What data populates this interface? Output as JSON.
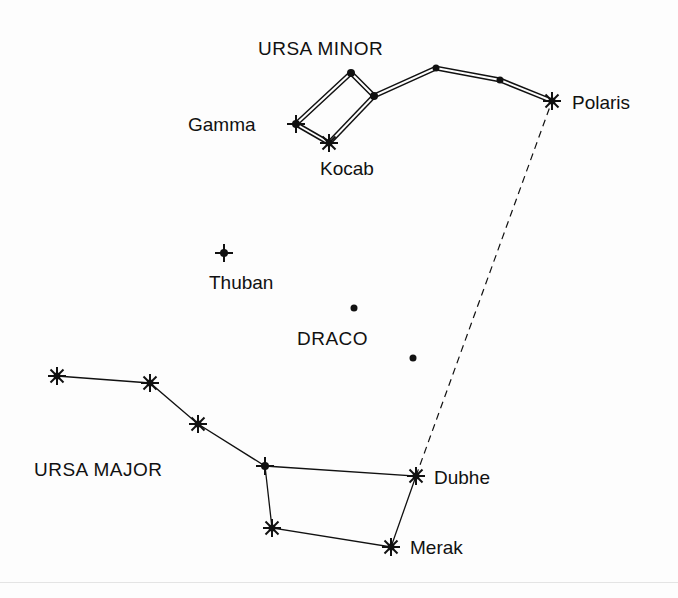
{
  "diagram": {
    "constellations": {
      "ursa_minor": "URSA  MINOR",
      "draco": "DRACO",
      "ursa_major": "URSA  MAJOR"
    },
    "stars": {
      "polaris": "Polaris",
      "gamma": "Gamma",
      "kocab": "Kocab",
      "thuban": "Thuban",
      "dubhe": "Dubhe",
      "merak": "Merak"
    },
    "pointer_line": "Dubhe to Polaris (dashed)",
    "colors": {
      "ink": "#111111",
      "background": "#fdfdfd"
    }
  }
}
